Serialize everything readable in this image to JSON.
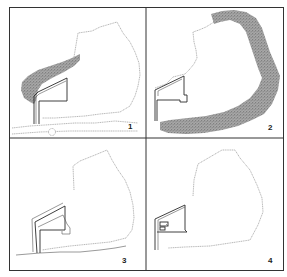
{
  "figure": {
    "type": "site-plan-sequence",
    "panels": [
      {
        "id": 1,
        "label": "1",
        "description": "site outline with planted strip along upper-left edge, building wall, ground line with small circular marker"
      },
      {
        "id": 2,
        "label": "2",
        "description": "site outline with thick planted band wrapping the right and bottom edge"
      },
      {
        "id": 3,
        "label": "3",
        "description": "site outline with building walls and ground line, no planting"
      },
      {
        "id": 4,
        "label": "4",
        "description": "site outline with building walls and small interior rooms"
      }
    ],
    "colors": {
      "frame": "#333333",
      "outline": "#9a9a9a",
      "wall": "#2a2a2a",
      "vegetation": "#7a7a7a"
    }
  }
}
